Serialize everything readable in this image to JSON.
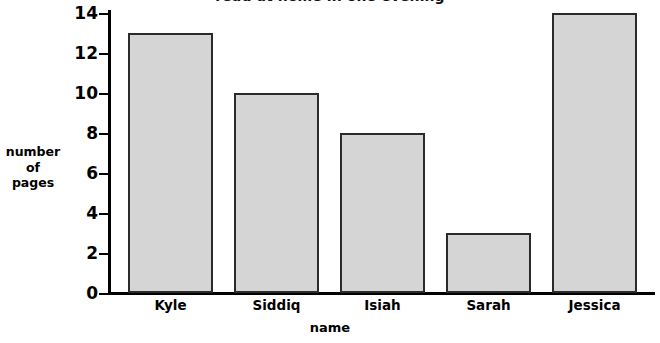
{
  "chart_data": {
    "type": "bar",
    "title": "read at home in one evening",
    "xlabel": "name",
    "ylabel_lines": [
      "number",
      "of",
      "pages"
    ],
    "ylabel": "number of pages",
    "categories": [
      "Kyle",
      "Siddiq",
      "Isiah",
      "Sarah",
      "Jessica"
    ],
    "values": [
      13,
      10,
      8,
      3,
      14
    ],
    "ylim": [
      0,
      14
    ],
    "yticks": [
      0,
      2,
      4,
      6,
      8,
      10,
      12,
      14
    ],
    "ytick_labels": [
      "0",
      "2",
      "4",
      "6",
      "8",
      "10",
      "12",
      "14"
    ],
    "grid": false,
    "legend": null,
    "bar_fill_color": "#d5d5d5",
    "bar_edge_color": "#2b2b2b",
    "axis_color": "#000000",
    "background_color": "#ffffff"
  }
}
